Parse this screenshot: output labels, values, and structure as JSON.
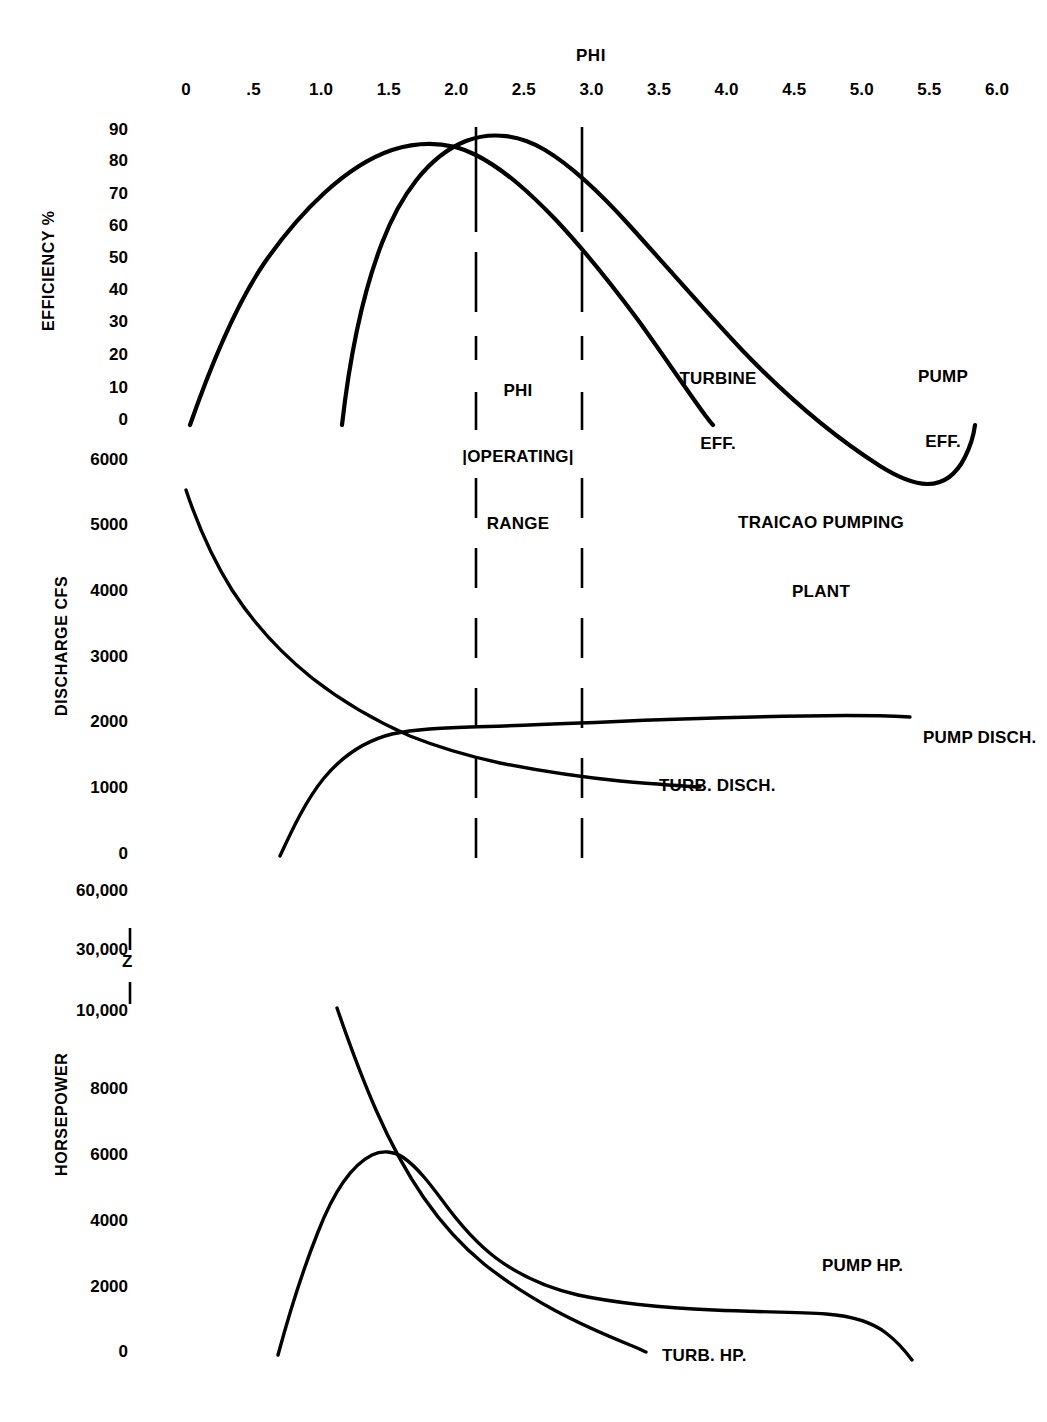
{
  "figure": {
    "title_lines": [
      "TRAICAO PUMPING",
      "PLANT"
    ],
    "x_axis_name": "PHI",
    "background": "#ffffff",
    "ink_color": "#000000"
  },
  "x_axis": {
    "label": "PHI",
    "ticks": [
      "0",
      ".5",
      "1.0",
      "1.5",
      "2.0",
      "2.5",
      "3.0",
      "3.5",
      "4.0",
      "4.5",
      "5.0",
      "5.5",
      "6.0"
    ],
    "tick_values": [
      0,
      0.5,
      1.0,
      1.5,
      2.0,
      2.5,
      3.0,
      3.5,
      4.0,
      4.5,
      5.0,
      5.5,
      6.0
    ],
    "min": 0,
    "max": 6.0
  },
  "operating_range": {
    "label_lines": [
      "PHI",
      "|OPERATING|",
      "RANGE"
    ],
    "phi_min": 2.13,
    "phi_max": 2.92
  },
  "panels": [
    {
      "key": "efficiency",
      "axis_title": "EFFICIENCY %",
      "ticks": [
        "90",
        "80",
        "70",
        "60",
        "50",
        "40",
        "30",
        "20",
        "10",
        "0"
      ],
      "tick_values": [
        90,
        80,
        70,
        60,
        50,
        40,
        30,
        20,
        10,
        0
      ],
      "series_labels": [
        {
          "name": "turbine-eff",
          "lines": [
            "TURBINE",
            "EFF."
          ]
        },
        {
          "name": "pump-eff",
          "lines": [
            "PUMP",
            "EFF."
          ]
        }
      ]
    },
    {
      "key": "discharge",
      "axis_title": "DISCHARGE CFS",
      "ticks": [
        "6000",
        "5000",
        "4000",
        "3000",
        "2000",
        "1000",
        "0"
      ],
      "tick_values": [
        6000,
        5000,
        4000,
        3000,
        2000,
        1000,
        0
      ],
      "series_labels": [
        {
          "name": "pump-disch",
          "lines": [
            "PUMP DISCH."
          ]
        },
        {
          "name": "turb-disch",
          "lines": [
            "TURB. DISCH."
          ]
        }
      ]
    },
    {
      "key": "horsepower",
      "axis_title": "HORSEPOWER",
      "ticks": [
        "60,000",
        "30,000",
        "Z",
        "10,000",
        "8000",
        "6000",
        "4000",
        "2000",
        "0"
      ],
      "tick_values": [
        60000,
        30000,
        null,
        10000,
        8000,
        6000,
        4000,
        2000,
        0
      ],
      "break_marker": "Z",
      "series_labels": [
        {
          "name": "pump-hp",
          "lines": [
            "PUMP HP."
          ]
        },
        {
          "name": "turb-hp",
          "lines": [
            "TURB. HP."
          ]
        }
      ]
    }
  ],
  "chart_data": {
    "type": "line",
    "title": "TRAICAO PUMPING PLANT",
    "xlabel": "PHI",
    "xlim": [
      0,
      6.0
    ],
    "grid": false,
    "legend": "inline-series-labels",
    "annotations": [
      {
        "text": "PHI OPERATING RANGE",
        "phi_from": 2.13,
        "phi_to": 2.92,
        "style": "dashed vertical bounds"
      },
      {
        "text": "TRAICAO PUMPING PLANT",
        "phi": 4.7,
        "panel": "discharge"
      }
    ],
    "subplots": [
      {
        "panel": "efficiency",
        "ylabel": "EFFICIENCY %",
        "ylim": [
          0,
          90
        ],
        "series": [
          {
            "name": "TURBINE EFF.",
            "x": [
              0.03,
              0.25,
              0.5,
              0.75,
              1.0,
              1.25,
              1.5,
              1.7,
              1.9,
              2.13,
              2.4,
              2.7,
              2.92,
              3.2,
              3.5,
              3.8,
              3.92
            ],
            "y": [
              0,
              28,
              50,
              66,
              76,
              82,
              85,
              85.5,
              85,
              83,
              79,
              72,
              66,
              55,
              40,
              17,
              0
            ]
          },
          {
            "name": "PUMP EFF.",
            "x": [
              1.15,
              1.35,
              1.6,
              1.85,
              2.13,
              2.4,
              2.6,
              2.92,
              3.3,
              3.7,
              4.1,
              4.5,
              4.9,
              5.3,
              5.6,
              5.85,
              5.9
            ],
            "y": [
              0,
              48,
              70,
              81,
              87,
              88,
              87.5,
              85,
              80,
              74,
              67,
              60,
              52,
              41,
              31,
              14,
              0
            ]
          }
        ]
      },
      {
        "panel": "discharge",
        "ylabel": "DISCHARGE CFS",
        "ylim": [
          0,
          6000
        ],
        "series": [
          {
            "name": "TURB. DISCH.",
            "x": [
              0.0,
              0.25,
              0.5,
              0.8,
              1.1,
              1.4,
              1.62,
              1.9,
              2.13,
              2.5,
              2.92,
              3.3,
              3.6,
              3.9
            ],
            "y": [
              5300,
              4500,
              3900,
              3300,
              2800,
              2400,
              2150,
              1900,
              1750,
              1500,
              1330,
              1200,
              1120,
              1060
            ]
          },
          {
            "name": "PUMP DISCH.",
            "x": [
              0.7,
              0.85,
              1.0,
              1.2,
              1.45,
              1.62,
              1.9,
              2.13,
              2.5,
              2.92,
              3.4,
              4.0,
              4.6,
              5.1,
              5.4
            ],
            "y": [
              0,
              500,
              900,
              1300,
              1600,
              1730,
              1800,
              1830,
              1880,
              1920,
              1960,
              2010,
              2050,
              2080,
              2090
            ]
          }
        ]
      },
      {
        "panel": "horsepower",
        "ylabel": "HORSEPOWER",
        "ylim": [
          0,
          10000
        ],
        "note": "axis broken between 10,000 and 30,000 / 60,000",
        "series": [
          {
            "name": "TURB. HP.",
            "x": [
              1.12,
              1.25,
              1.42,
              1.6,
              1.8,
              2.0,
              2.2,
              2.5,
              2.9,
              3.3,
              3.7,
              3.9
            ],
            "y": [
              10500,
              9200,
              7200,
              5600,
              4200,
              3100,
              2400,
              1700,
              1150,
              700,
              350,
              200
            ]
          },
          {
            "name": "PUMP HP.",
            "x": [
              0.68,
              0.82,
              1.0,
              1.2,
              1.42,
              1.6,
              1.85,
              2.13,
              2.5,
              2.92,
              3.4,
              4.0,
              4.6,
              5.0,
              5.3,
              5.55,
              5.75,
              5.85
            ],
            "y": [
              0,
              2300,
              4000,
              5300,
              6150,
              6100,
              5600,
              5000,
              4400,
              3900,
              3500,
              3150,
              3000,
              2920,
              2800,
              2400,
              1300,
              200
            ]
          }
        ]
      }
    ]
  }
}
